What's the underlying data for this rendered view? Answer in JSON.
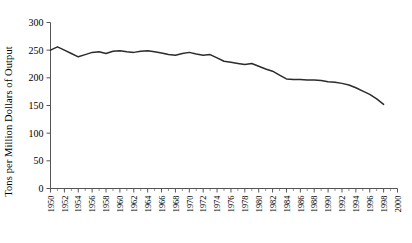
{
  "chart_data": {
    "type": "line",
    "title": "",
    "xlabel": "",
    "ylabel": "Tons per Million Dollars of Output",
    "xlim": [
      1950,
      2000
    ],
    "ylim": [
      0,
      300
    ],
    "grid": false,
    "legend": null,
    "yticks": [
      0,
      50,
      100,
      150,
      200,
      250,
      300
    ],
    "ytick_labels": [
      "0",
      "50",
      "100",
      "150",
      "200",
      "250",
      "300"
    ],
    "xticks": [
      1950,
      1952,
      1954,
      1956,
      1958,
      1960,
      1962,
      1964,
      1966,
      1968,
      1970,
      1972,
      1974,
      1976,
      1978,
      1980,
      1982,
      1984,
      1986,
      1988,
      1990,
      1992,
      1994,
      1996,
      1998,
      2000
    ],
    "xtick_labels": [
      "1950",
      "1952",
      "1954",
      "1956",
      "1958",
      "1960",
      "1962",
      "1964",
      "1966",
      "1968",
      "1970",
      "1972",
      "1974",
      "1976",
      "1978",
      "1980",
      "1982",
      "1984",
      "1986",
      "1988",
      "1990",
      "1992",
      "1994",
      "1996",
      "1998",
      "2000"
    ],
    "xtick_minor_step": 1,
    "line_color": "#2b2b2b",
    "x": [
      1950,
      1951,
      1952,
      1953,
      1954,
      1955,
      1956,
      1957,
      1958,
      1959,
      1960,
      1961,
      1962,
      1963,
      1964,
      1965,
      1966,
      1967,
      1968,
      1969,
      1970,
      1971,
      1972,
      1973,
      1974,
      1975,
      1976,
      1977,
      1978,
      1979,
      1980,
      1981,
      1982,
      1983,
      1984,
      1985,
      1986,
      1987,
      1988,
      1989,
      1990,
      1991,
      1992,
      1993,
      1994,
      1995,
      1996,
      1997,
      1998
    ],
    "values": [
      250,
      256,
      250,
      244,
      238,
      242,
      246,
      247,
      244,
      248,
      249,
      247,
      246,
      248,
      249,
      247,
      245,
      242,
      241,
      244,
      246,
      243,
      241,
      242,
      236,
      230,
      228,
      226,
      224,
      226,
      221,
      216,
      212,
      205,
      198,
      197,
      197,
      196,
      196,
      195,
      193,
      192,
      190,
      187,
      182,
      176,
      170,
      162,
      152
    ]
  }
}
